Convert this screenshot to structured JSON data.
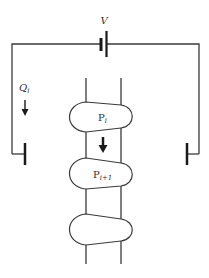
{
  "diagram": {
    "type": "circuit-schematic",
    "colors": {
      "line": "#3a3a3a",
      "plate": "#1a1a1a",
      "text": "#333333",
      "background": "#ffffff"
    },
    "battery": {
      "label": "V"
    },
    "charge_label": {
      "main": "Q",
      "subscript": "i"
    },
    "capsules": [
      {
        "label_main": "P",
        "label_subscript": "i"
      },
      {
        "label_main": "P",
        "label_subscript": "i+1"
      },
      {
        "label_main": "",
        "label_subscript": ""
      }
    ],
    "arrows": [
      {
        "name": "charge-flow-arrow",
        "direction": "down"
      },
      {
        "name": "capsule-motion-arrow",
        "direction": "down"
      }
    ],
    "electrodes": [
      "left",
      "right"
    ]
  }
}
